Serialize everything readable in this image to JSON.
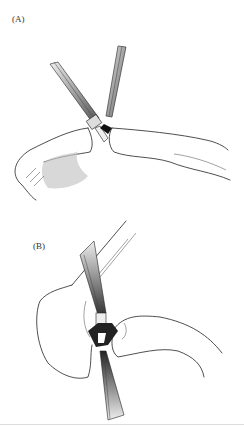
{
  "figure": {
    "panels": [
      {
        "label": "(A)",
        "description": "Two forceps grasping at the junction of two curved structures"
      },
      {
        "label": "(B)",
        "description": "Forceps from above and below meeting at junction of two structures"
      }
    ],
    "colors": {
      "ink": "#222222",
      "shade": "#c8c8c8",
      "background": "#ffffff"
    }
  }
}
